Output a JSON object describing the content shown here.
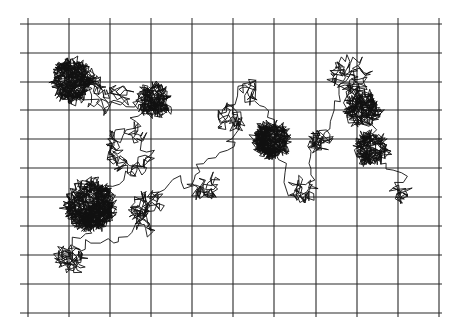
{
  "figure": {
    "kind": "random-walk-trajectory",
    "background": "#ffffff",
    "line_color": "#111111",
    "grid_color": "#2a2a2a",
    "grid": {
      "x_lines": [
        28,
        69,
        110,
        151,
        192,
        233,
        274,
        316,
        357,
        398,
        439
      ],
      "y_lines": [
        24,
        53,
        82,
        110,
        139,
        168,
        197,
        226,
        255,
        284,
        313
      ],
      "x_min": 28,
      "x_max": 442,
      "y_min": 24,
      "y_max": 313,
      "left_tick_len": 8,
      "top_tick_len": 6
    },
    "walk": {
      "seed": 20251,
      "step_len": 7,
      "waypoints": [
        {
          "x": 72,
          "y": 80,
          "dwell": 700,
          "spread": 18
        },
        {
          "x": 110,
          "y": 100,
          "dwell": 80,
          "spread": 22
        },
        {
          "x": 155,
          "y": 100,
          "dwell": 350,
          "spread": 14
        },
        {
          "x": 130,
          "y": 150,
          "dwell": 120,
          "spread": 22
        },
        {
          "x": 90,
          "y": 205,
          "dwell": 1100,
          "spread": 22
        },
        {
          "x": 70,
          "y": 260,
          "dwell": 90,
          "spread": 14
        },
        {
          "x": 150,
          "y": 210,
          "dwell": 120,
          "spread": 20
        },
        {
          "x": 205,
          "y": 185,
          "dwell": 60,
          "spread": 12
        },
        {
          "x": 230,
          "y": 120,
          "dwell": 60,
          "spread": 12
        },
        {
          "x": 250,
          "y": 90,
          "dwell": 30,
          "spread": 8
        },
        {
          "x": 272,
          "y": 140,
          "dwell": 650,
          "spread": 15
        },
        {
          "x": 300,
          "y": 190,
          "dwell": 50,
          "spread": 10
        },
        {
          "x": 325,
          "y": 140,
          "dwell": 60,
          "spread": 12
        },
        {
          "x": 350,
          "y": 75,
          "dwell": 120,
          "spread": 16
        },
        {
          "x": 362,
          "y": 110,
          "dwell": 350,
          "spread": 14
        },
        {
          "x": 372,
          "y": 148,
          "dwell": 320,
          "spread": 13
        },
        {
          "x": 400,
          "y": 193,
          "dwell": 30,
          "spread": 6
        }
      ]
    }
  }
}
